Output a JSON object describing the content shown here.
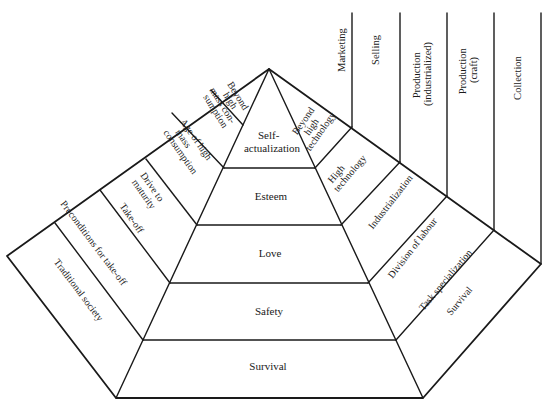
{
  "diagram": {
    "type": "pyramid-with-wings",
    "center_pyramid": {
      "title": "Hierarchy of needs",
      "levels": [
        {
          "label": "Self-\nactualization",
          "line1": "Self-",
          "line2": "actualization"
        },
        {
          "label": "Esteem"
        },
        {
          "label": "Love"
        },
        {
          "label": "Safety"
        },
        {
          "label": "Survival"
        }
      ]
    },
    "left_wing": {
      "title": "Stages of economic growth",
      "stages": [
        {
          "label": "Beyond high mass con- sumption",
          "lines": [
            "Beyond",
            "high",
            "mass con-",
            "sumption"
          ]
        },
        {
          "label": "Age of high mass consumption",
          "lines": [
            "Age of high",
            "mass",
            "consumption"
          ]
        },
        {
          "label": "Drive to maturity",
          "lines": [
            "Drive to",
            "maturity"
          ]
        },
        {
          "label": "Take-off",
          "lines": [
            "Take-off"
          ]
        },
        {
          "label": "Preconditions for take-off",
          "lines": [
            "Preconditions for take-off"
          ]
        },
        {
          "label": "Traditional society",
          "lines": [
            "Traditional society"
          ]
        }
      ]
    },
    "right_wing": {
      "title": "Technology stages",
      "stages": [
        {
          "label": "Beyond high technology",
          "lines": [
            "Beyond",
            "high",
            "technology"
          ]
        },
        {
          "label": "High technology",
          "lines": [
            "High",
            "technology"
          ]
        },
        {
          "label": "Industrialization",
          "lines": [
            "Industrialization"
          ]
        },
        {
          "label": "Division of labour",
          "lines": [
            "Division of labour"
          ]
        },
        {
          "label": "Task specialization",
          "lines": [
            "Task specialization"
          ]
        },
        {
          "label": "Survival",
          "lines": [
            "Survival"
          ]
        }
      ]
    },
    "columns": [
      {
        "label": "Marketing",
        "lines": [
          "Marketing"
        ]
      },
      {
        "label": "Selling",
        "lines": [
          "Selling"
        ]
      },
      {
        "label": "Production (industrialized)",
        "lines": [
          "Production",
          "(industrialized)"
        ]
      },
      {
        "label": "Production (craft)",
        "lines": [
          "Production",
          "(craft)"
        ]
      },
      {
        "label": "Collection",
        "lines": [
          "Collection"
        ]
      }
    ],
    "colors": {
      "line": "#1a1a1a",
      "background": "#ffffff",
      "text": "#1a1a1a"
    }
  }
}
